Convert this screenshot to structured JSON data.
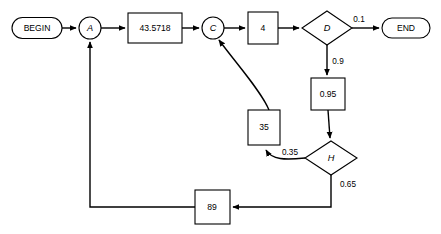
{
  "diagram": {
    "colors": {
      "stroke": "#000000",
      "fill": "#ffffff",
      "background": "#ffffff"
    },
    "nodes": [
      {
        "id": "begin",
        "label": "BEGIN",
        "shape": "stadium",
        "cx": 37,
        "cy": 28,
        "w": 50,
        "h": 21
      },
      {
        "id": "a",
        "label": "A",
        "shape": "circle",
        "cx": 90,
        "cy": 28,
        "r": 11,
        "italic": true
      },
      {
        "id": "v43",
        "label": "43.5718",
        "shape": "rect",
        "cx": 155,
        "cy": 28,
        "w": 54,
        "h": 30
      },
      {
        "id": "c",
        "label": "C",
        "shape": "circle",
        "cx": 213,
        "cy": 28,
        "r": 11,
        "italic": true
      },
      {
        "id": "v4",
        "label": "4",
        "shape": "rect",
        "cx": 263,
        "cy": 28,
        "w": 30,
        "h": 32
      },
      {
        "id": "d",
        "label": "D",
        "shape": "diamond",
        "cx": 327,
        "cy": 28,
        "w": 50,
        "h": 34,
        "italic": true
      },
      {
        "id": "end",
        "label": "END",
        "shape": "stadium",
        "cx": 406,
        "cy": 28,
        "w": 48,
        "h": 20
      },
      {
        "id": "v095",
        "label": "0.95",
        "shape": "rect",
        "cx": 328,
        "cy": 94,
        "w": 34,
        "h": 32
      },
      {
        "id": "v35",
        "label": "35",
        "shape": "rect",
        "cx": 264,
        "cy": 127,
        "w": 32,
        "h": 35
      },
      {
        "id": "h",
        "label": "H",
        "shape": "diamond",
        "cx": 331,
        "cy": 158,
        "w": 52,
        "h": 34,
        "italic": true
      },
      {
        "id": "v89",
        "label": "89",
        "shape": "rect",
        "cx": 212,
        "cy": 207,
        "w": 35,
        "h": 34
      }
    ],
    "edges": [
      {
        "id": "begin-a",
        "from": "begin",
        "to": "a",
        "label": ""
      },
      {
        "id": "a-43",
        "from": "a",
        "to": "v43",
        "label": ""
      },
      {
        "id": "43-c",
        "from": "v43",
        "to": "c",
        "label": ""
      },
      {
        "id": "c-4",
        "from": "c",
        "to": "v4",
        "label": ""
      },
      {
        "id": "4-d",
        "from": "v4",
        "to": "d",
        "label": ""
      },
      {
        "id": "d-end",
        "from": "d",
        "to": "end",
        "label": "0.1",
        "label_x": 359,
        "label_y": 20
      },
      {
        "id": "d-095",
        "from": "d",
        "to": "v095",
        "label": "0.9",
        "label_x": 338,
        "label_y": 62
      },
      {
        "id": "095-h",
        "from": "v095",
        "to": "h",
        "label": ""
      },
      {
        "id": "h-35",
        "from": "h",
        "to": "v35",
        "label": "0.35",
        "label_x": 290,
        "label_y": 153
      },
      {
        "id": "35-c",
        "from": "v35",
        "to": "c",
        "label": ""
      },
      {
        "id": "h-89",
        "from": "h",
        "to": "v89",
        "label": "0.65",
        "label_x": 348,
        "label_y": 185
      },
      {
        "id": "89-a",
        "from": "v89",
        "to": "a",
        "label": ""
      }
    ]
  }
}
